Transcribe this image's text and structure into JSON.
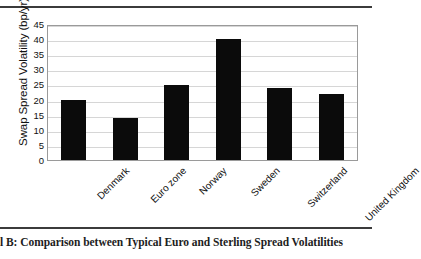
{
  "figure": {
    "caption": "l B: Comparison between Typical Euro and Sterling Spread Volatilities"
  },
  "chart_data": {
    "type": "bar",
    "title": "",
    "xlabel": "",
    "ylabel": "Swap Spread Volatility (bp/yr)",
    "categories": [
      "Denmark",
      "Euro zone",
      "Norway",
      "Sweden",
      "Switzerland",
      "United Kingdom"
    ],
    "values": [
      20,
      14,
      24.8,
      40,
      23.7,
      21.8
    ],
    "ylim": [
      0,
      45
    ],
    "yticks": [
      0,
      5,
      10,
      15,
      20,
      25,
      30,
      35,
      40,
      45
    ],
    "ytick_labels": [
      "0",
      "5",
      "10",
      "15",
      "20",
      "25",
      "30",
      "35",
      "40",
      "45"
    ],
    "grid": true,
    "legend": "none",
    "bar_color": "#0b0b0b",
    "xtick_rotation": -45
  }
}
